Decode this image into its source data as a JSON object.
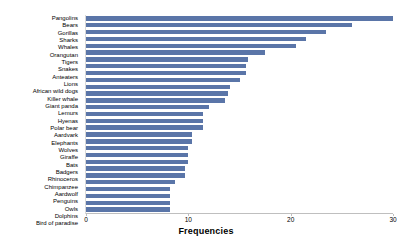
{
  "chart": {
    "colors": {
      "bar": "#5a75a8",
      "axis": "#bfbfbf",
      "text": "#000000",
      "background": "#ffffff"
    }
  },
  "chart_data": {
    "type": "bar",
    "orientation": "horizontal",
    "title": "",
    "xlabel": "Frequencies",
    "ylabel": "",
    "xlim": [
      0,
      30
    ],
    "xticks": [
      0,
      10,
      20,
      30
    ],
    "xticklabels": [
      "0",
      "10",
      "20",
      "30"
    ],
    "grid": false,
    "legend": false,
    "categories": [
      "Pangolins",
      "Bears",
      "Gorillas",
      "Sharks",
      "Whales",
      "Orangutan",
      "Tigers",
      "Snakes",
      "Anteaters",
      "Lions",
      "African wild dogs",
      "Killer whale",
      "Giant panda",
      "Lemurs",
      "Hyenas",
      "Polar bear",
      "Aardvark",
      "Elephants",
      "Wolves",
      "Giraffe",
      "Bats",
      "Badgers",
      "Rhinoceros",
      "Chimpanzee",
      "Aardwolf",
      "Penguins",
      "Owls",
      "Dolphins",
      "Bird of paradise"
    ],
    "values": [
      30,
      26,
      23.5,
      21.5,
      20.5,
      17.5,
      15.8,
      15.6,
      15.6,
      15,
      14.1,
      13.9,
      13.6,
      12,
      11.4,
      11.4,
      11.4,
      10.4,
      10.4,
      10,
      10,
      10,
      9.7,
      9.7,
      8.7,
      8.2,
      8.2,
      8.2,
      8.2
    ]
  }
}
